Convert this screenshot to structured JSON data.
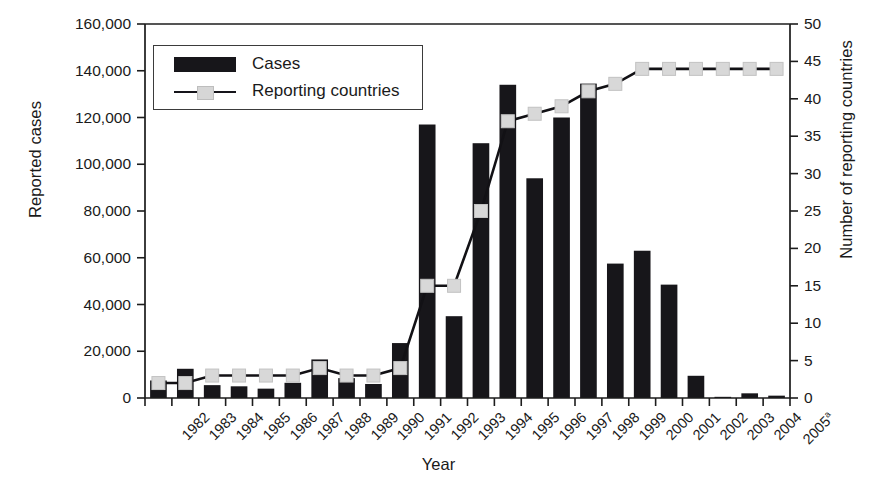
{
  "chart_data": {
    "type": "bar",
    "title": "",
    "xlabel": "Year",
    "ylabel": "Reported cases",
    "ylabel_secondary": "Number of reporting countries",
    "categories": [
      "1982",
      "1983",
      "1984",
      "1985",
      "1986",
      "1987",
      "1988",
      "1989",
      "1990",
      "1991",
      "1992",
      "1993",
      "1994",
      "1995",
      "1996",
      "1997",
      "1998",
      "1999",
      "2000",
      "2001",
      "2002",
      "2003",
      "2004",
      "2005"
    ],
    "category_labels": [
      "1982",
      "1983",
      "1984",
      "1985",
      "1986",
      "1987",
      "1988",
      "1989",
      "1990",
      "1991",
      "1992",
      "1993",
      "1994",
      "1995",
      "1996",
      "1997",
      "1998",
      "1999",
      "2000",
      "2001",
      "2002",
      "2003",
      "2004",
      "2005"
    ],
    "last_category_superscript": "a",
    "ylim": [
      0,
      160000
    ],
    "yticks": [
      0,
      20000,
      40000,
      60000,
      80000,
      100000,
      120000,
      140000,
      160000
    ],
    "ytick_labels": [
      "0",
      "20,000",
      "40,000",
      "60,000",
      "80,000",
      "100,000",
      "120,000",
      "140,000",
      "160,000"
    ],
    "ylim_secondary": [
      0,
      50
    ],
    "yticks_secondary": [
      0,
      5,
      10,
      15,
      20,
      25,
      30,
      35,
      40,
      45,
      50
    ],
    "ytick_labels_secondary": [
      "0",
      "5",
      "10",
      "15",
      "20",
      "25",
      "30",
      "35",
      "40",
      "45",
      "50"
    ],
    "grid": false,
    "legend_position": "upper-left-inside",
    "series": [
      {
        "name": "Cases",
        "type": "bar",
        "axis": "left",
        "color": "#17161a",
        "values": [
          7500,
          12500,
          5500,
          5000,
          4000,
          6500,
          16500,
          8500,
          6000,
          23500,
          117000,
          35000,
          109000,
          134000,
          94000,
          120000,
          134500,
          57500,
          63000,
          48500,
          9500,
          500,
          2000,
          1000
        ]
      },
      {
        "name": "Reporting countries",
        "type": "line",
        "axis": "right",
        "color": "#121115",
        "marker_color": "#d8d8d8",
        "values": [
          2,
          2,
          3,
          3,
          3,
          3,
          4,
          3,
          3,
          4,
          15,
          15,
          25,
          37,
          38,
          39,
          41,
          42,
          44,
          44,
          44,
          44,
          44,
          44
        ]
      }
    ]
  },
  "legend": {
    "items": [
      {
        "label": "Cases",
        "style": "bar"
      },
      {
        "label": "Reporting countries",
        "style": "line-marker"
      }
    ]
  },
  "colors": {
    "bar": "#17161a",
    "line": "#121115",
    "marker": "#d8d8d8",
    "axis": "#1c1c1c",
    "background": "#ffffff"
  }
}
